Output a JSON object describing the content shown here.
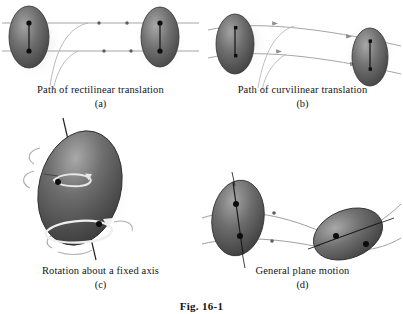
{
  "figure": {
    "title": "Fig. 16-1",
    "panels": [
      {
        "id": "a",
        "caption": "Path of rectilinear translation",
        "sublabel": "(a)",
        "motion_type": "rectilinear translation",
        "bodies": 2,
        "path_shape": "straight parallel lines",
        "tracked_points": 2
      },
      {
        "id": "b",
        "caption": "Path of curvilinear translation",
        "sublabel": "(b)",
        "motion_type": "curvilinear translation",
        "bodies": 2,
        "path_shape": "parallel curved arcs",
        "tracked_points": 2
      },
      {
        "id": "c",
        "caption": "Rotation about a fixed axis",
        "sublabel": "(c)",
        "motion_type": "rotation about a fixed axis",
        "bodies": 1,
        "path_shape": "circular arrows about axis",
        "tracked_points": 2
      },
      {
        "id": "d",
        "caption": "General plane motion",
        "sublabel": "(d)",
        "motion_type": "general plane motion",
        "bodies": 2,
        "path_shape": "non-parallel curved paths",
        "tracked_points": 2
      }
    ]
  },
  "colors": {
    "background": "#ffffff",
    "body_dark": "#4a4a4a",
    "body_mid": "#6e6e6e",
    "body_light": "#9a9a9a",
    "body_edge": "#3a3a3a",
    "path_line": "#8a8a8a",
    "axis_line": "#2b2b2b",
    "point_marker": "#101010",
    "text": "#141414",
    "shadow": "#d8d8d8"
  }
}
